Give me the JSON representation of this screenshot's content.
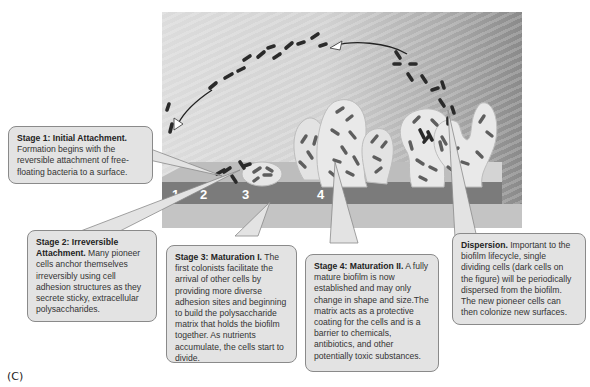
{
  "figure": {
    "panel_label": "(C)",
    "stage_numbers": [
      "1",
      "2",
      "3",
      "4"
    ],
    "colors": {
      "callout_fill": "#e3e3e3",
      "callout_border": "#8a8a8a",
      "surface_band": "#7a7a7a",
      "bacteria": "#3a3a3a"
    }
  },
  "callouts": {
    "stage1": {
      "title": "Stage 1: Initial Attachment.",
      "body": "Formation begins with the reversible attachment of free-floating bacteria to a surface."
    },
    "stage2": {
      "title": "Stage 2: Irreversible Attachment.",
      "body": "Many pioneer cells anchor themselves irreversibly using cell adhesion structures as they secrete sticky, extracellular polysaccharides."
    },
    "stage3": {
      "title": "Stage 3: Maturation I.",
      "body": "The first colonists facilitate the arrival of other cells by providing more diverse adhesion sites and beginning to build the polysaccharide matrix that holds the biofilm together. As nutrients accumulate, the cells start to divide."
    },
    "stage4": {
      "title": "Stage 4: Maturation II.",
      "body": "A fully mature biofilm is now established and may only change in shape and size.The matrix acts as a protective coating for the cells and is a barrier to chemicals, antibiotics, and other potentially toxic substances."
    },
    "dispersion": {
      "title": "Dispersion.",
      "body": "Important to the biofilm lifecycle, single dividing cells (dark cells on the figure) will be periodically dispersed from the biofilm. The new pioneer cells can then colonize new surfaces."
    }
  }
}
